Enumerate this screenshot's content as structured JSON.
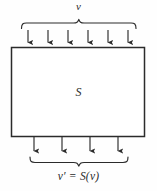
{
  "diagram": {
    "type": "block-diagram",
    "background_color": "#fefefe",
    "stroke_color": "#2b2b2b",
    "labels": {
      "input": "v",
      "block": "S",
      "output": "v′ = S(v)"
    },
    "block": {
      "name": "S",
      "x": 11,
      "y": 47,
      "width": 134,
      "height": 90,
      "fill": "#ffffff",
      "stroke": "#2b2b2b",
      "stroke_width": 1.4
    },
    "input_brace": {
      "orientation": "up",
      "x_start": 21,
      "x_end": 136,
      "y": 22
    },
    "output_brace": {
      "orientation": "down",
      "x_start": 30,
      "x_end": 128,
      "y": 160
    },
    "input_arrows": {
      "count": 6,
      "direction": "down",
      "x_positions": [
        28,
        48,
        68,
        88,
        108,
        128
      ],
      "y_start": 30,
      "y_end": 47
    },
    "output_arrows": {
      "count": 4,
      "direction": "down",
      "x_positions": [
        34,
        62,
        90,
        118
      ],
      "y_start": 137,
      "y_end": 155
    }
  }
}
